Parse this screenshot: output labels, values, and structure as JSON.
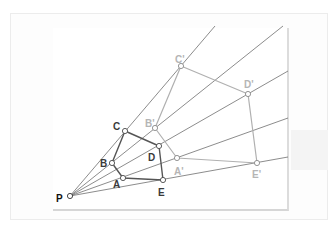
{
  "diagram": {
    "colors": {
      "background": "#ffffff",
      "ray": "#6e6e6e",
      "original_polygon": "#555555",
      "image_polygon": "#b0b0b0",
      "original_label": "#3a3a3a",
      "image_label": "#b5b5b5",
      "center_label": "#111111",
      "point_fill": "#ffffff"
    },
    "center": {
      "label": "P",
      "x": 70,
      "y": 196
    },
    "rays": [
      {
        "name": "ray-through-B-C-Cprime",
        "x2": 215,
        "y2": 26
      },
      {
        "name": "ray-through-B-Bprime",
        "x2": 283,
        "y2": 26
      },
      {
        "name": "ray-through-D-Dprime",
        "x2": 288,
        "y2": 71
      },
      {
        "name": "ray-through-A-Aprime",
        "x2": 288,
        "y2": 118
      },
      {
        "name": "ray-through-E-Eprime",
        "x2": 288,
        "y2": 157
      }
    ],
    "original_points": [
      {
        "label": "A",
        "x": 123,
        "y": 178,
        "lx": 113,
        "ly": 188
      },
      {
        "label": "B",
        "x": 112,
        "y": 163,
        "lx": 100,
        "ly": 167
      },
      {
        "label": "C",
        "x": 125,
        "y": 131,
        "lx": 113,
        "ly": 130
      },
      {
        "label": "D",
        "x": 159,
        "y": 146,
        "lx": 148,
        "ly": 161
      },
      {
        "label": "E",
        "x": 163,
        "y": 180,
        "lx": 158,
        "ly": 196
      }
    ],
    "image_points": [
      {
        "label": "A'",
        "x": 177,
        "y": 158,
        "lx": 174,
        "ly": 175
      },
      {
        "label": "B'",
        "x": 155,
        "y": 128,
        "lx": 145,
        "ly": 127
      },
      {
        "label": "C'",
        "x": 181,
        "y": 66,
        "lx": 175,
        "ly": 63
      },
      {
        "label": "D'",
        "x": 248,
        "y": 94,
        "lx": 244,
        "ly": 88
      },
      {
        "label": "E'",
        "x": 257,
        "y": 163,
        "lx": 252,
        "ly": 178
      }
    ]
  }
}
